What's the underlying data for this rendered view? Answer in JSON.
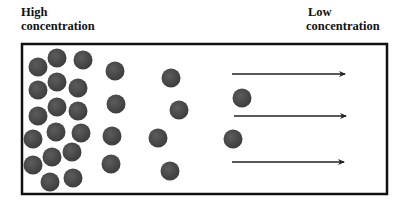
{
  "labels": {
    "high": [
      "High",
      "concentration"
    ],
    "low": [
      "Low",
      "concentration"
    ]
  },
  "colors": {
    "particle": "#4a4a4a",
    "particle_edge": "#3a3a3a",
    "border": "#111111",
    "arrow": "#222222"
  },
  "container": {
    "x": 22,
    "y": 44,
    "width": 365,
    "height": 150
  },
  "particle_radius": 9.5,
  "particles": [
    [
      38,
      67
    ],
    [
      57,
      58
    ],
    [
      83,
      60
    ],
    [
      115,
      71
    ],
    [
      171,
      78
    ],
    [
      38,
      90
    ],
    [
      57,
      82
    ],
    [
      78,
      88
    ],
    [
      116,
      104
    ],
    [
      179,
      110
    ],
    [
      242,
      98
    ],
    [
      38,
      116
    ],
    [
      57,
      107
    ],
    [
      78,
      111
    ],
    [
      33,
      139
    ],
    [
      56,
      132
    ],
    [
      81,
      133
    ],
    [
      112,
      136
    ],
    [
      158,
      138
    ],
    [
      233,
      139
    ],
    [
      33,
      165
    ],
    [
      52,
      157
    ],
    [
      72,
      152
    ],
    [
      111,
      164
    ],
    [
      170,
      171
    ],
    [
      50,
      182
    ],
    [
      73,
      178
    ]
  ],
  "arrows": [
    {
      "x1": 232,
      "x2": 345,
      "y": 74
    },
    {
      "x1": 234,
      "x2": 346,
      "y": 116
    },
    {
      "x1": 232,
      "x2": 344,
      "y": 162
    }
  ]
}
